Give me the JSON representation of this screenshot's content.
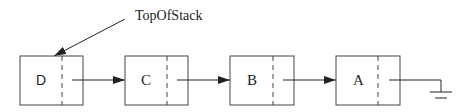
{
  "diagram": {
    "title_label": "TopOfStack",
    "nodes": [
      {
        "label": "D"
      },
      {
        "label": "C"
      },
      {
        "label": "B"
      },
      {
        "label": "A"
      }
    ],
    "terminator": "null-ground"
  },
  "colors": {
    "stroke": "#333333",
    "background": "#ffffff"
  }
}
